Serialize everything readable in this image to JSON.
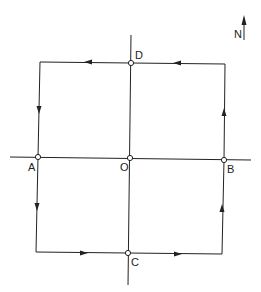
{
  "diagram": {
    "type": "circuit-path",
    "compass_label": "N",
    "points": {
      "D": {
        "label": "D"
      },
      "A": {
        "label": "A"
      },
      "O": {
        "label": "O"
      },
      "B": {
        "label": "B"
      },
      "C": {
        "label": "C"
      }
    },
    "path_direction": "D -> west -> down to A -> south -> east to C -> east -> up to B -> north -> west to D",
    "colors": {
      "line": "#222222",
      "background": "#ffffff"
    }
  }
}
